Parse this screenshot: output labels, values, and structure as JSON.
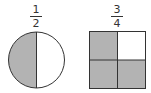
{
  "figures": [
    {
      "shape": "circle",
      "fraction": {
        "numerator": "1",
        "denominator": "2"
      },
      "parts": 2,
      "shaded_parts": 1
    },
    {
      "shape": "square",
      "fraction": {
        "numerator": "3",
        "denominator": "4"
      },
      "parts": 4,
      "shaded_parts": 3
    }
  ],
  "colors": {
    "shade": "#b3b3b3",
    "outline": "#333333",
    "background": "#ffffff"
  }
}
